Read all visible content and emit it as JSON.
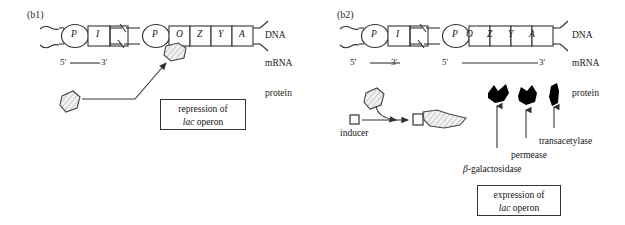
{
  "figure": {
    "title_b1": "(b1)",
    "title_b2": "(b2)",
    "row_labels": {
      "dna": "DNA",
      "mrna": "mRNA",
      "protein": "protein"
    }
  },
  "panel_b1": {
    "label": "(b1)",
    "regulatory_genes": [
      "P",
      "I"
    ],
    "operon_genes": [
      "P",
      "O",
      "Z",
      "Y",
      "A"
    ],
    "mrna_left": {
      "five_prime": "5′",
      "three_prime": "3′"
    },
    "callout": {
      "line1": "repression of",
      "line2_italic": "lac",
      "line2_rest": " operon"
    },
    "icons": {
      "repressor": "repressor-protein-icon",
      "repressor_bound": "repressor-bound-to-operator-icon",
      "arrow": "binding-arrow-icon"
    }
  },
  "panel_b2": {
    "label": "(b2)",
    "regulatory_genes": [
      "P",
      "I"
    ],
    "operon_genes": [
      "P",
      "O",
      "Z",
      "Y",
      "A"
    ],
    "mrna_left": {
      "five_prime": "5′",
      "three_prime": "3′"
    },
    "mrna_right": {
      "five_prime": "5′",
      "three_prime": "3′"
    },
    "inducer_label": "inducer",
    "enzymes": [
      {
        "name": "β-galactosidase",
        "greek": "β",
        "rest": "-galactosidase"
      },
      {
        "name": "permease",
        "greek": "",
        "rest": "permease"
      },
      {
        "name": "transacetylase",
        "greek": "",
        "rest": "transacetylase"
      }
    ],
    "callout": {
      "line1": "expression of",
      "line2_italic": "lac",
      "line2_rest": " operon"
    },
    "icons": {
      "repressor": "repressor-protein-icon",
      "inducer": "inducer-square-icon",
      "inactive_complex": "inactive-repressor-inducer-complex-icon",
      "curved_arrow": "inducer-binding-arrow-icon",
      "enzyme_arrows": "enzyme-production-arrow-icon"
    }
  },
  "colors": {
    "ink": "#1a1a1a",
    "line": "#333333",
    "enzyme_fill": "#000000",
    "hatch": "#777777"
  }
}
